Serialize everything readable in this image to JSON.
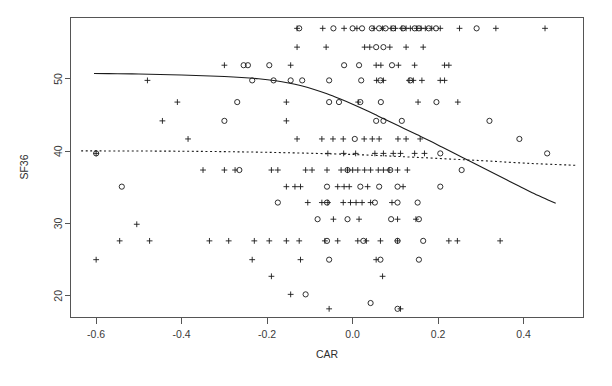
{
  "chart_data": {
    "type": "scatter",
    "title": "",
    "xlabel": "CAR",
    "ylabel": "SF36",
    "xlim": [
      -0.66,
      0.54
    ],
    "ylim": [
      17.0,
      58.5
    ],
    "xticks": [
      -0.6,
      -0.4,
      -0.2,
      0.0,
      0.2,
      0.4
    ],
    "xticklabels": [
      "-0.6",
      "-0.4",
      "-0.2",
      "0.0",
      "0.2",
      "0.4"
    ],
    "yticks": [
      20,
      30,
      40,
      50
    ],
    "yticklabels": [
      "20",
      "30",
      "40",
      "50"
    ],
    "grid": false,
    "legend": null,
    "frame": "box",
    "series": [
      {
        "name": "plus-group",
        "marker": "plus",
        "color": "#1a1a1a",
        "points": [
          [
            -0.13,
            57.0
          ],
          [
            -0.07,
            57.0
          ],
          [
            -0.02,
            57.0
          ],
          [
            0.01,
            57.0
          ],
          [
            0.05,
            57.0
          ],
          [
            0.07,
            57.0
          ],
          [
            0.09,
            57.0
          ],
          [
            0.1,
            57.0
          ],
          [
            0.115,
            57.0
          ],
          [
            0.125,
            57.0
          ],
          [
            0.135,
            57.0
          ],
          [
            0.15,
            57.0
          ],
          [
            0.16,
            57.0
          ],
          [
            0.17,
            57.0
          ],
          [
            0.185,
            57.0
          ],
          [
            0.205,
            57.0
          ],
          [
            0.25,
            57.0
          ],
          [
            0.335,
            57.0
          ],
          [
            0.45,
            57.0
          ],
          [
            -0.13,
            54.4
          ],
          [
            -0.062,
            54.4
          ],
          [
            0.028,
            54.4
          ],
          [
            0.04,
            54.4
          ],
          [
            0.087,
            54.4
          ],
          [
            0.125,
            54.4
          ],
          [
            0.165,
            54.4
          ],
          [
            -0.145,
            51.9
          ],
          [
            -0.3,
            51.9
          ],
          [
            0.055,
            51.9
          ],
          [
            0.066,
            51.9
          ],
          [
            0.107,
            51.9
          ],
          [
            0.145,
            51.9
          ],
          [
            0.215,
            51.9
          ],
          [
            0.225,
            51.9
          ],
          [
            -0.48,
            49.8
          ],
          [
            0.056,
            49.8
          ],
          [
            0.072,
            49.8
          ],
          [
            0.132,
            49.8
          ],
          [
            0.142,
            49.8
          ],
          [
            0.162,
            49.8
          ],
          [
            0.205,
            49.8
          ],
          [
            0.215,
            49.8
          ],
          [
            -0.41,
            46.8
          ],
          [
            -0.155,
            46.8
          ],
          [
            0.013,
            46.8
          ],
          [
            0.153,
            46.8
          ],
          [
            0.246,
            46.8
          ],
          [
            -0.445,
            44.2
          ],
          [
            -0.155,
            44.2
          ],
          [
            -0.385,
            41.7
          ],
          [
            -0.13,
            41.7
          ],
          [
            -0.072,
            41.7
          ],
          [
            -0.046,
            41.7
          ],
          [
            -0.022,
            41.7
          ],
          [
            0.027,
            41.7
          ],
          [
            0.046,
            41.7
          ],
          [
            0.062,
            41.7
          ],
          [
            0.106,
            41.7
          ],
          [
            0.125,
            41.7
          ],
          [
            0.158,
            41.7
          ],
          [
            -0.6,
            39.7
          ],
          [
            -0.058,
            39.7
          ],
          [
            -0.021,
            39.7
          ],
          [
            0.007,
            39.7
          ],
          [
            0.052,
            39.7
          ],
          [
            0.072,
            39.7
          ],
          [
            0.095,
            39.7
          ],
          [
            0.112,
            39.7
          ],
          [
            0.145,
            39.7
          ],
          [
            0.168,
            39.7
          ],
          [
            -0.35,
            37.4
          ],
          [
            -0.3,
            37.4
          ],
          [
            -0.275,
            37.4
          ],
          [
            -0.19,
            37.4
          ],
          [
            -0.175,
            37.4
          ],
          [
            -0.11,
            37.4
          ],
          [
            -0.095,
            37.4
          ],
          [
            -0.06,
            37.4
          ],
          [
            -0.027,
            37.4
          ],
          [
            -0.012,
            37.4
          ],
          [
            0.0,
            37.4
          ],
          [
            0.012,
            37.4
          ],
          [
            0.028,
            37.4
          ],
          [
            0.042,
            37.4
          ],
          [
            0.06,
            37.4
          ],
          [
            0.072,
            37.4
          ],
          [
            0.085,
            37.4
          ],
          [
            0.105,
            37.4
          ],
          [
            0.128,
            37.4
          ],
          [
            -0.155,
            35.1
          ],
          [
            -0.135,
            35.1
          ],
          [
            -0.122,
            35.1
          ],
          [
            -0.035,
            35.1
          ],
          [
            -0.02,
            35.1
          ],
          [
            -0.008,
            35.1
          ],
          [
            0.035,
            35.1
          ],
          [
            0.118,
            35.1
          ],
          [
            -0.105,
            32.9
          ],
          [
            -0.072,
            32.9
          ],
          [
            -0.058,
            32.9
          ],
          [
            -0.022,
            32.9
          ],
          [
            -0.005,
            32.9
          ],
          [
            0.008,
            32.9
          ],
          [
            0.022,
            32.9
          ],
          [
            0.042,
            32.9
          ],
          [
            0.092,
            32.9
          ],
          [
            -0.045,
            30.6
          ],
          [
            0.015,
            30.6
          ],
          [
            0.105,
            30.6
          ],
          [
            0.148,
            30.6
          ],
          [
            -0.505,
            29.9
          ],
          [
            -0.545,
            27.6
          ],
          [
            -0.475,
            27.6
          ],
          [
            -0.335,
            27.6
          ],
          [
            -0.29,
            27.6
          ],
          [
            -0.23,
            27.6
          ],
          [
            -0.195,
            27.6
          ],
          [
            -0.155,
            27.6
          ],
          [
            -0.125,
            27.6
          ],
          [
            -0.065,
            27.6
          ],
          [
            -0.035,
            27.6
          ],
          [
            0.012,
            27.6
          ],
          [
            0.032,
            27.6
          ],
          [
            0.065,
            27.6
          ],
          [
            0.105,
            27.6
          ],
          [
            0.225,
            27.6
          ],
          [
            0.245,
            27.6
          ],
          [
            0.345,
            27.6
          ],
          [
            -0.6,
            25.0
          ],
          [
            -0.235,
            25.0
          ],
          [
            -0.122,
            25.0
          ],
          [
            0.055,
            25.0
          ],
          [
            -0.19,
            22.7
          ],
          [
            0.07,
            22.7
          ],
          [
            -0.145,
            20.2
          ],
          [
            -0.055,
            18.2
          ],
          [
            0.112,
            18.2
          ]
        ]
      },
      {
        "name": "circle-group",
        "marker": "circle",
        "color": "#1a1a1a",
        "points": [
          [
            -0.125,
            57.0
          ],
          [
            -0.045,
            57.0
          ],
          [
            0.0,
            57.0
          ],
          [
            0.022,
            57.0
          ],
          [
            0.045,
            57.0
          ],
          [
            0.062,
            57.0
          ],
          [
            0.077,
            57.0
          ],
          [
            0.095,
            57.0
          ],
          [
            0.118,
            57.0
          ],
          [
            0.145,
            57.0
          ],
          [
            0.155,
            57.0
          ],
          [
            0.178,
            57.0
          ],
          [
            0.195,
            57.0
          ],
          [
            0.29,
            57.0
          ],
          [
            0.055,
            54.4
          ],
          [
            0.072,
            54.4
          ],
          [
            -0.255,
            51.9
          ],
          [
            -0.245,
            51.9
          ],
          [
            -0.195,
            51.9
          ],
          [
            -0.02,
            51.9
          ],
          [
            0.015,
            51.9
          ],
          [
            0.092,
            51.9
          ],
          [
            -0.235,
            49.8
          ],
          [
            -0.185,
            49.8
          ],
          [
            -0.145,
            49.8
          ],
          [
            -0.118,
            49.8
          ],
          [
            -0.055,
            49.8
          ],
          [
            0.02,
            49.8
          ],
          [
            0.065,
            49.8
          ],
          [
            0.135,
            49.8
          ],
          [
            -0.27,
            46.8
          ],
          [
            -0.055,
            46.8
          ],
          [
            -0.032,
            46.8
          ],
          [
            0.018,
            46.8
          ],
          [
            0.066,
            46.8
          ],
          [
            0.196,
            46.8
          ],
          [
            -0.3,
            44.2
          ],
          [
            0.055,
            44.2
          ],
          [
            0.072,
            44.2
          ],
          [
            0.115,
            44.2
          ],
          [
            0.32,
            44.2
          ],
          [
            0.005,
            41.7
          ],
          [
            0.39,
            41.7
          ],
          [
            -0.6,
            39.7
          ],
          [
            0.205,
            39.7
          ],
          [
            0.455,
            39.7
          ],
          [
            -0.265,
            37.4
          ],
          [
            -0.012,
            37.4
          ],
          [
            0.088,
            37.4
          ],
          [
            0.255,
            37.4
          ],
          [
            -0.54,
            35.1
          ],
          [
            -0.06,
            35.1
          ],
          [
            0.018,
            35.1
          ],
          [
            0.062,
            35.1
          ],
          [
            0.105,
            35.1
          ],
          [
            0.205,
            35.1
          ],
          [
            -0.175,
            32.9
          ],
          [
            -0.06,
            32.9
          ],
          [
            0.052,
            32.9
          ],
          [
            0.105,
            32.9
          ],
          [
            0.152,
            32.9
          ],
          [
            -0.082,
            30.6
          ],
          [
            -0.012,
            30.6
          ],
          [
            0.09,
            30.6
          ],
          [
            0.155,
            30.6
          ],
          [
            -0.06,
            27.6
          ],
          [
            0.025,
            27.6
          ],
          [
            0.105,
            27.6
          ],
          [
            0.165,
            27.6
          ],
          [
            -0.055,
            25.0
          ],
          [
            0.065,
            25.0
          ],
          [
            0.155,
            25.0
          ],
          [
            -0.11,
            20.2
          ],
          [
            0.042,
            19.0
          ],
          [
            0.105,
            18.2
          ]
        ]
      }
    ],
    "fits": [
      {
        "name": "solid-fit-curve",
        "style": "solid",
        "color": "#1a1a1a",
        "points": [
          [
            -0.605,
            50.75
          ],
          [
            -0.55,
            50.72
          ],
          [
            -0.5,
            50.68
          ],
          [
            -0.45,
            50.62
          ],
          [
            -0.4,
            50.55
          ],
          [
            -0.35,
            50.45
          ],
          [
            -0.3,
            50.33
          ],
          [
            -0.26,
            50.2
          ],
          [
            -0.22,
            50.02
          ],
          [
            -0.18,
            49.75
          ],
          [
            -0.15,
            49.45
          ],
          [
            -0.12,
            49.05
          ],
          [
            -0.09,
            48.55
          ],
          [
            -0.06,
            47.95
          ],
          [
            -0.03,
            47.25
          ],
          [
            0.0,
            46.5
          ],
          [
            0.03,
            45.7
          ],
          [
            0.06,
            44.85
          ],
          [
            0.09,
            44.0
          ],
          [
            0.12,
            43.15
          ],
          [
            0.15,
            42.3
          ],
          [
            0.18,
            41.45
          ],
          [
            0.21,
            40.55
          ],
          [
            0.24,
            39.65
          ],
          [
            0.27,
            38.75
          ],
          [
            0.3,
            37.85
          ],
          [
            0.33,
            36.95
          ],
          [
            0.36,
            36.05
          ],
          [
            0.39,
            35.15
          ],
          [
            0.42,
            34.25
          ],
          [
            0.45,
            33.45
          ],
          [
            0.475,
            32.8
          ]
        ]
      },
      {
        "name": "dotted-fit-line",
        "style": "dotted",
        "color": "#1a1a1a",
        "points": [
          [
            -0.635,
            40.05
          ],
          [
            -0.4,
            40.0
          ],
          [
            -0.2,
            39.85
          ],
          [
            0.0,
            39.55
          ],
          [
            0.15,
            39.15
          ],
          [
            0.3,
            38.7
          ],
          [
            0.42,
            38.3
          ],
          [
            0.525,
            38.05
          ]
        ]
      }
    ]
  }
}
